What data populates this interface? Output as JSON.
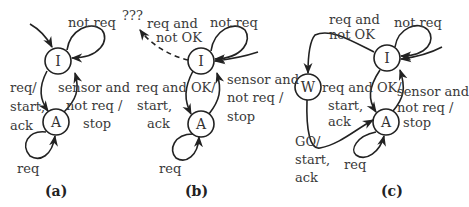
{
  "diagrams": [
    {
      "caption": "(a)",
      "states": {
        "I": "I",
        "A": "A"
      },
      "labels": {
        "self_I": "not req",
        "I_to_A": [
          "req/",
          "start,",
          "ack"
        ],
        "A_to_I": [
          "sensor and",
          "not req /",
          "stop"
        ],
        "self_A": "req"
      }
    },
    {
      "caption": "(b)",
      "states": {
        "I": "I",
        "A": "A"
      },
      "labels": {
        "unknown": "???",
        "I_to_unknown": [
          "req and",
          "not OK"
        ],
        "self_I": "not req",
        "I_to_A": [
          "req and OK/",
          "start,",
          "ack"
        ],
        "A_to_I": [
          "sensor and",
          "not req /",
          "stop"
        ],
        "self_A": "req"
      }
    },
    {
      "caption": "(c)",
      "states": {
        "W": "W",
        "I": "I",
        "A": "A"
      },
      "labels": {
        "I_to_W": [
          "req and",
          "not OK"
        ],
        "self_I": "not req",
        "I_to_A": [
          "req and OK/",
          "start,",
          "ack"
        ],
        "A_to_I": [
          "sensor and",
          "not req /",
          "stop"
        ],
        "W_to_A": [
          "GO/",
          "start,",
          "ack"
        ],
        "self_A": "req"
      }
    }
  ]
}
